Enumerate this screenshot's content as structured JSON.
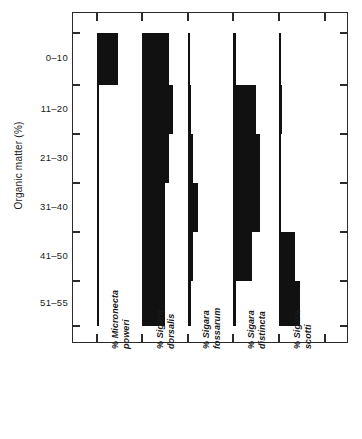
{
  "chart_data": {
    "type": "bar",
    "title": "",
    "subtitle": "",
    "orientation": "horizontal-strata",
    "xlabel": "",
    "ylabel": "Organic matter (%)",
    "grid": false,
    "legend": null,
    "axis_style": "percentage strata diagram, each taxon drawn from its own zero baseline",
    "categories": [
      "0-10",
      "11-20",
      "21-30",
      "31-40",
      "41-50",
      "51-55"
    ],
    "y_tick_labels": [
      "0–10",
      "11–20",
      "21–30",
      "31–40",
      "41–50",
      "51–55"
    ],
    "x_axis_ticks_count": 6,
    "xlim": [
      0,
      100
    ],
    "series": [
      {
        "name": "% Micronecta poweri",
        "genus": "Micronecta",
        "species": "poweri",
        "prefix": "%",
        "values": [
          27,
          0,
          0,
          0,
          0,
          0
        ]
      },
      {
        "name": "% Sigara dorsalis",
        "genus": "Sigara",
        "species": "dorsalis",
        "prefix": "%",
        "values": [
          34,
          40,
          34,
          29,
          29,
          29
        ]
      },
      {
        "name": "% Sigara fossarum",
        "genus": "Sigara",
        "species": "fossarum",
        "prefix": "%",
        "values": [
          0,
          4,
          7,
          13,
          7,
          4
        ]
      },
      {
        "name": "% Sigara distincta",
        "genus": "Sigara",
        "species": "distincta",
        "prefix": "%",
        "values": [
          4,
          29,
          34,
          34,
          24,
          4
        ]
      },
      {
        "name": "% Sigara scotti",
        "genus": "Sigara",
        "species": "scotti",
        "prefix": "%",
        "values": [
          0,
          4,
          0,
          0,
          20,
          27
        ]
      }
    ],
    "bands": [
      {
        "label": "0–10",
        "top_px": 32,
        "bottom_px": 84
      },
      {
        "label": "11–20",
        "bottom_px": 133,
        "top_px": 84
      },
      {
        "label": "21–30",
        "bottom_px": 182,
        "top_px": 133
      },
      {
        "label": "31–40",
        "bottom_px": 231,
        "top_px": 182
      },
      {
        "label": "41–50",
        "bottom_px": 280,
        "top_px": 231
      },
      {
        "label": "51–55",
        "bottom_px": 325,
        "top_px": 280
      }
    ],
    "colors": {
      "bar_fill": "#111111",
      "axis": "#2b2b2b",
      "background": "#ffffff",
      "text": "#1a1a1a"
    }
  }
}
